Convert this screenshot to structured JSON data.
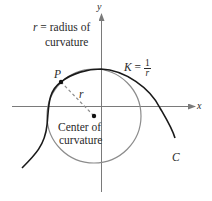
{
  "diagram": {
    "axes": {
      "x_label": "x",
      "y_label": "y"
    },
    "labels": {
      "radius_def_line1_var": "r",
      "radius_def_line1_rest": " = radius of",
      "radius_def_line2": "curvature",
      "point": "P",
      "radius": "r",
      "curvature_K": "K",
      "curvature_eq": " = ",
      "curvature_num": "1",
      "curvature_den": "r",
      "center_line1": "Center of",
      "center_line2": "curvature",
      "curve_name": "C"
    },
    "colors": {
      "curve": "#1a1a1a",
      "circle": "#8c8c8c",
      "axes": "#7a7a7a",
      "radius_line": "#8c8c8c",
      "text": "#2a2a2a"
    }
  }
}
